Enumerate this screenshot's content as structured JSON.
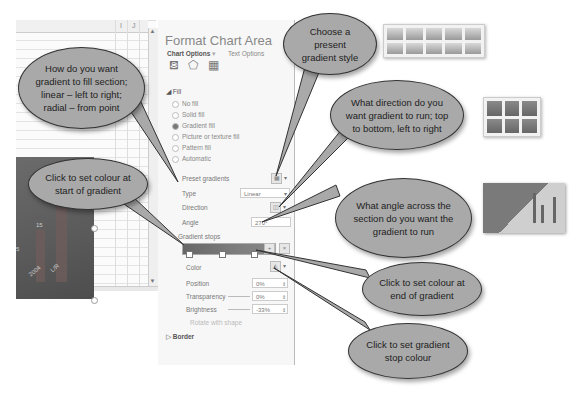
{
  "spreadsheet": {
    "column_headers": [
      "I",
      "J"
    ],
    "chart": {
      "bar_value_label": "15",
      "x_labels": [
        "2004",
        "L/R"
      ],
      "axis_tick": "5"
    }
  },
  "panel": {
    "title": "Format Chart Area",
    "tabs": [
      "Chart Options",
      "Text Options"
    ],
    "tab_icons": [
      "fill-line-icon",
      "effects-icon",
      "size-properties-icon"
    ],
    "fill_section": "Fill",
    "fill_options": [
      {
        "label": "No fill",
        "selected": false
      },
      {
        "label": "Solid fill",
        "selected": false
      },
      {
        "label": "Gradient fill",
        "selected": true
      },
      {
        "label": "Picture or texture fill",
        "selected": false
      },
      {
        "label": "Pattern fill",
        "selected": false
      },
      {
        "label": "Automatic",
        "selected": false
      }
    ],
    "preset_gradients_label": "Preset gradients",
    "type_label": "Type",
    "type_value": "Linear",
    "direction_label": "Direction",
    "angle_label": "Angle",
    "angle_value": "270°",
    "gradient_stops_label": "Gradient stops",
    "color_label": "Color",
    "position_label": "Position",
    "position_value": "0%",
    "transparency_label": "Transparency",
    "transparency_value": "0%",
    "brightness_label": "Brightness",
    "brightness_value": "-33%",
    "rotate_label": "Rotate with shape",
    "border_section": "Border"
  },
  "callouts": {
    "type": "How do you want gradient to fill section; linear – left to right; radial – from point",
    "preset": "Choose a present gradient style",
    "direction": "What direction do you want gradient to run; top to bottom, left to right",
    "start_color": "Click to set colour at start of gradient",
    "angle": "What angle across the section do you want the gradient to run",
    "end_color": "Click to set colour at end of gradient",
    "stop_color": "Click to set gradient stop colour"
  },
  "colors": {
    "callout_fill": "#a9a9a9",
    "callout_border": "#333333",
    "panel_bg": "#f7f7f7"
  }
}
